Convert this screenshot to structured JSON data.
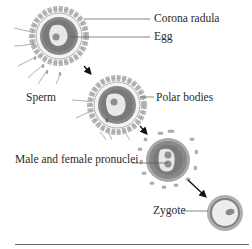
{
  "labels": {
    "corona_radula": "Corona radula",
    "egg": "Egg",
    "sperm": "Sperm",
    "polar_bodies": "Polar bodies",
    "pronuclei": "Male and female pronuclei",
    "zygote": "Zygote"
  },
  "colors": {
    "outer_ring": "#a8a8a8",
    "white_ring": "#f2f2f2",
    "cytoplasm_ring": "#8a8a8a",
    "inner_cytoplasm": "#7a7a7a",
    "nucleus_area": "#e6e6e6",
    "nucleus": "#9a9a9a",
    "corona_cells": "#b5b5b5",
    "line": "#555555",
    "arrow": "#111111"
  },
  "stages": [
    {
      "name": "egg-with-sperm",
      "cx": 59,
      "cy": 36
    },
    {
      "name": "sperm-entry",
      "cx": 117,
      "cy": 105
    },
    {
      "name": "pronuclei",
      "cx": 168,
      "cy": 160
    },
    {
      "name": "zygote",
      "cx": 225,
      "cy": 213
    }
  ]
}
